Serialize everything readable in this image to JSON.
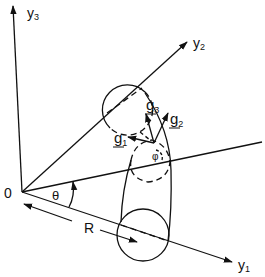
{
  "diagram": {
    "type": "geometry",
    "axes": {
      "y1": {
        "label": "y",
        "subscript": "1"
      },
      "y2": {
        "label": "y",
        "subscript": "2"
      },
      "y3": {
        "label": "y",
        "subscript": "3"
      }
    },
    "origin_label": "0",
    "angle_theta_label": "θ",
    "angle_phi_label": "φ",
    "radius_label": "R",
    "vectors": [
      {
        "label": "g",
        "subscript": "1"
      },
      {
        "label": "g",
        "subscript": "2"
      },
      {
        "label": "g",
        "subscript": "3"
      }
    ],
    "colors": {
      "stroke": "#111111",
      "background": "#ffffff"
    }
  }
}
